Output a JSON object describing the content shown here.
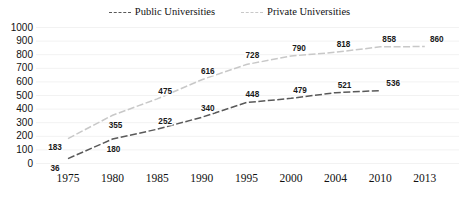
{
  "chart_data": {
    "type": "line",
    "title": "",
    "xlabel": "",
    "ylabel": "",
    "categories": [
      "1975",
      "1980",
      "1985",
      "1990",
      "1995",
      "2000",
      "2004",
      "2010",
      "2013"
    ],
    "ylim": [
      0,
      1000
    ],
    "yticks": [
      0,
      100,
      200,
      300,
      400,
      500,
      600,
      700,
      800,
      900,
      1000
    ],
    "grid": true,
    "legend_position": "top-center",
    "series": [
      {
        "name": "Public Universities",
        "color": "#595959",
        "style": "dashed",
        "values": [
          36,
          180,
          252,
          340,
          448,
          479,
          521,
          536,
          null
        ],
        "labels": [
          "36",
          "180",
          "252",
          "340",
          "448",
          "479",
          "521",
          "536",
          ""
        ]
      },
      {
        "name": "Private Universities",
        "color": "#c8c8c8",
        "style": "dashed",
        "values": [
          183,
          355,
          475,
          616,
          728,
          790,
          818,
          858,
          860
        ],
        "labels": [
          "183",
          "355",
          "475",
          "616",
          "728",
          "790",
          "818",
          "858",
          "860"
        ]
      }
    ]
  },
  "legend": {
    "entries": [
      {
        "label": "Public Universities",
        "color": "#595959"
      },
      {
        "label": "Private Universities",
        "color": "#c8c8c8"
      }
    ]
  },
  "axes": {
    "y_tick_labels": [
      "1000",
      "900",
      "800",
      "700",
      "600",
      "500",
      "400",
      "300",
      "200",
      "100",
      "0"
    ],
    "x_tick_labels": [
      "1975",
      "1980",
      "1985",
      "1990",
      "1995",
      "2000",
      "2004",
      "2010",
      "2013"
    ]
  }
}
